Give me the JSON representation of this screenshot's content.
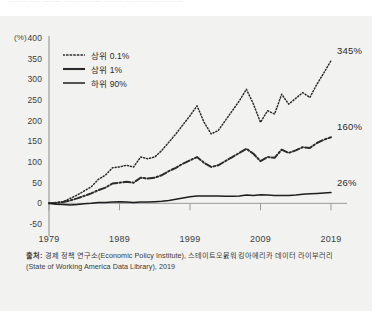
{
  "top_strip": {
    "ghost_text": "——  —  ——   ————  ——  ——————"
  },
  "source": {
    "prefix": "출처:",
    "text": " 경제 정책 연구소(Economic Policy Institute), 스테이트오붌워킹아에리카 데이터 라이부러리(State of Working America Data Library), 2019"
  },
  "chart_data": {
    "type": "line",
    "title": "",
    "subtitle": "",
    "xlabel": "",
    "ylabel": "",
    "yunit": "(%)",
    "ylim": [
      -50,
      400
    ],
    "xlim": [
      1979,
      2019
    ],
    "grid": false,
    "legend_position": "top-left",
    "yticks": [
      400,
      350,
      300,
      250,
      200,
      150,
      100,
      50,
      0,
      -50
    ],
    "ytick_labels": [
      "400",
      "350",
      "300",
      "250",
      "200",
      "150",
      "100",
      "50",
      "0",
      "-50"
    ],
    "xticks": [
      1979,
      1989,
      1999,
      2009,
      2019
    ],
    "xtick_labels": [
      "1979",
      "1989",
      "1999",
      "2009",
      "2019"
    ],
    "end_labels": [
      "345%",
      "160%",
      "26%"
    ],
    "series": [
      {
        "name": "상위 0.1%",
        "style": "dotted",
        "color": "#2b2b2b",
        "end_label": "345%",
        "x": [
          1979,
          1980,
          1981,
          1982,
          1983,
          1984,
          1985,
          1986,
          1987,
          1988,
          1989,
          1990,
          1991,
          1992,
          1993,
          1994,
          1995,
          1996,
          1997,
          1998,
          1999,
          2000,
          2001,
          2002,
          2003,
          2004,
          2005,
          2006,
          2007,
          2008,
          2009,
          2010,
          2011,
          2012,
          2013,
          2014,
          2015,
          2016,
          2017,
          2018,
          2019
        ],
        "values": [
          0,
          2,
          4,
          12,
          20,
          30,
          40,
          58,
          68,
          86,
          88,
          92,
          88,
          112,
          108,
          112,
          128,
          148,
          168,
          190,
          212,
          236,
          196,
          168,
          176,
          200,
          224,
          248,
          276,
          240,
          196,
          224,
          216,
          264,
          240,
          254,
          268,
          256,
          288,
          316,
          345
        ]
      },
      {
        "name": "상위 1%",
        "style": "dashdot",
        "color": "#2b2b2b",
        "end_label": "160%",
        "x": [
          1979,
          1980,
          1981,
          1982,
          1983,
          1984,
          1985,
          1986,
          1987,
          1988,
          1989,
          1990,
          1991,
          1992,
          1993,
          1994,
          1995,
          1996,
          1997,
          1998,
          1999,
          2000,
          2001,
          2002,
          2003,
          2004,
          2005,
          2006,
          2007,
          2008,
          2009,
          2010,
          2011,
          2012,
          2013,
          2014,
          2015,
          2016,
          2017,
          2018,
          2019
        ],
        "values": [
          0,
          1,
          3,
          7,
          12,
          18,
          24,
          32,
          38,
          48,
          50,
          52,
          50,
          62,
          60,
          62,
          68,
          78,
          86,
          96,
          104,
          112,
          98,
          88,
          92,
          102,
          112,
          122,
          132,
          120,
          102,
          112,
          110,
          130,
          122,
          128,
          136,
          134,
          146,
          154,
          160
        ]
      },
      {
        "name": "하위 90%",
        "style": "solid",
        "color": "#1e1e1e",
        "end_label": "26%",
        "x": [
          1979,
          1980,
          1981,
          1982,
          1983,
          1984,
          1985,
          1986,
          1987,
          1988,
          1989,
          1990,
          1991,
          1992,
          1993,
          1994,
          1995,
          1996,
          1997,
          1998,
          1999,
          2000,
          2001,
          2002,
          2003,
          2004,
          2005,
          2006,
          2007,
          2008,
          2009,
          2010,
          2011,
          2012,
          2013,
          2014,
          2015,
          2016,
          2017,
          2018,
          2019
        ],
        "values": [
          0,
          -2,
          -3,
          -4,
          -3,
          -1,
          0,
          2,
          2,
          3,
          4,
          3,
          2,
          3,
          3,
          4,
          5,
          7,
          10,
          13,
          16,
          18,
          18,
          18,
          18,
          17,
          17,
          18,
          20,
          19,
          21,
          20,
          19,
          19,
          19,
          20,
          22,
          23,
          24,
          25,
          26
        ]
      }
    ]
  }
}
